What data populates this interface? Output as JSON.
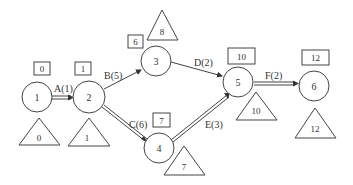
{
  "diagram": {
    "type": "activity-on-arrow network",
    "nodes": [
      {
        "id": "1",
        "label": "1",
        "cx": 37,
        "cy": 97,
        "box": "0",
        "triangle": "0"
      },
      {
        "id": "2",
        "label": "2",
        "cx": 89,
        "cy": 97,
        "box": "1",
        "triangle": "1"
      },
      {
        "id": "3",
        "label": "3",
        "cx": 156,
        "cy": 61,
        "box": "6",
        "triangle": "8"
      },
      {
        "id": "4",
        "label": "4",
        "cx": 159,
        "cy": 148,
        "box": "7",
        "triangle": "7"
      },
      {
        "id": "5",
        "label": "5",
        "cx": 238,
        "cy": 82,
        "box": "10",
        "triangle": "10"
      },
      {
        "id": "6",
        "label": "6",
        "cx": 314,
        "cy": 86,
        "box": "12",
        "triangle": "12"
      }
    ],
    "edges": [
      {
        "from": "1",
        "to": "2",
        "label": "A(1)",
        "critical": true
      },
      {
        "from": "2",
        "to": "3",
        "label": "B(5)",
        "critical": false
      },
      {
        "from": "2",
        "to": "4",
        "label": "C(6)",
        "critical": true
      },
      {
        "from": "3",
        "to": "5",
        "label": "D(2)",
        "critical": false
      },
      {
        "from": "4",
        "to": "5",
        "label": "E(3)",
        "critical": true
      },
      {
        "from": "5",
        "to": "6",
        "label": "F(2)",
        "critical": true
      }
    ]
  }
}
